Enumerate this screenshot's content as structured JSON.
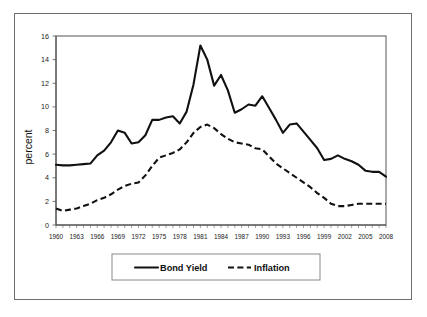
{
  "chart_data": {
    "type": "line",
    "title": "",
    "xlabel": "",
    "ylabel": "percent",
    "xlim": [
      1960,
      2008
    ],
    "ylim": [
      0,
      16
    ],
    "yticks": [
      0,
      2,
      4,
      6,
      8,
      10,
      12,
      14,
      16
    ],
    "xticks": [
      1960,
      1963,
      1966,
      1969,
      1972,
      1975,
      1978,
      1981,
      1984,
      1987,
      1990,
      1993,
      1996,
      1999,
      2002,
      2005,
      2008
    ],
    "grid": false,
    "legend_position": "bottom-center",
    "x": [
      1960,
      1961,
      1962,
      1963,
      1964,
      1965,
      1966,
      1967,
      1968,
      1969,
      1970,
      1971,
      1972,
      1973,
      1974,
      1975,
      1976,
      1977,
      1978,
      1979,
      1980,
      1981,
      1982,
      1983,
      1984,
      1985,
      1986,
      1987,
      1988,
      1989,
      1990,
      1991,
      1992,
      1993,
      1994,
      1995,
      1996,
      1997,
      1998,
      1999,
      2000,
      2001,
      2002,
      2003,
      2004,
      2005,
      2006,
      2007,
      2008
    ],
    "series": [
      {
        "name": "Bond Yield",
        "style": "solid",
        "color": "#111111",
        "values": [
          5.1,
          5.05,
          5.05,
          5.1,
          5.15,
          5.2,
          5.9,
          6.3,
          7.0,
          8.0,
          7.8,
          6.9,
          7.0,
          7.6,
          8.9,
          8.9,
          9.1,
          9.2,
          8.6,
          9.6,
          11.9,
          15.2,
          14.0,
          11.8,
          12.7,
          11.4,
          9.5,
          9.8,
          10.2,
          10.1,
          10.9,
          9.9,
          8.9,
          7.8,
          8.5,
          8.6,
          7.9,
          7.2,
          6.5,
          5.5,
          5.6,
          5.9,
          5.6,
          5.4,
          5.1,
          4.6,
          4.5,
          4.5,
          4.1
        ]
      },
      {
        "name": "Inflation",
        "style": "dashed",
        "color": "#111111",
        "values": [
          1.4,
          1.2,
          1.3,
          1.4,
          1.6,
          1.8,
          2.1,
          2.3,
          2.6,
          3.0,
          3.3,
          3.5,
          3.6,
          4.2,
          5.0,
          5.7,
          5.9,
          6.1,
          6.4,
          7.0,
          7.8,
          8.3,
          8.5,
          8.2,
          7.7,
          7.3,
          7.0,
          6.9,
          6.8,
          6.5,
          6.4,
          5.8,
          5.2,
          4.8,
          4.4,
          4.0,
          3.6,
          3.2,
          2.7,
          2.3,
          1.8,
          1.6,
          1.6,
          1.7,
          1.8,
          1.8,
          1.8,
          1.8,
          1.8
        ]
      }
    ]
  },
  "legend": {
    "entries": [
      {
        "label": "Bond Yield",
        "style": "solid"
      },
      {
        "label": "Inflation",
        "style": "dashed"
      }
    ]
  },
  "axes": {
    "y_title": "percent"
  }
}
